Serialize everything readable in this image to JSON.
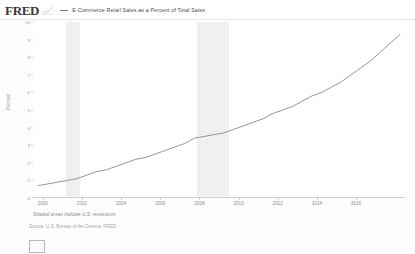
{
  "header": {
    "logo_text": "FRED",
    "logo_icon": "line-chart-icon",
    "series_legend_label": "E-Commerce Retail Sales as a Percent of Total Sales"
  },
  "footer": {
    "recession_note": "Shaded areas indicate U.S. recessions",
    "source": "Source: U.S. Bureau of the Census, FRED"
  },
  "chart_data": {
    "type": "line",
    "title": "E-Commerce Retail Sales as a Percent of Total Sales",
    "xlabel": "",
    "ylabel": "Percent",
    "xlim": [
      1999.5,
      2018.5
    ],
    "ylim": [
      0,
      10
    ],
    "grid": false,
    "legend_position": "top",
    "ytick_labels": [
      "0",
      "1",
      "2",
      "3",
      "4",
      "5",
      "6",
      "7",
      "8",
      "9",
      "10"
    ],
    "ytick_values": [
      0,
      1,
      2,
      3,
      4,
      5,
      6,
      7,
      8,
      9,
      10
    ],
    "xtick_labels": [
      "2000",
      "2002",
      "2004",
      "2006",
      "2008",
      "2010",
      "2012",
      "2014",
      "2016"
    ],
    "xtick_values": [
      2000,
      2002,
      2004,
      2006,
      2008,
      2010,
      2012,
      2014,
      2016
    ],
    "line_color": "#8a8a8a",
    "recession_color": "#eef0f2",
    "recession_bands": [
      {
        "start": 2001.2,
        "end": 2001.9
      },
      {
        "start": 2007.9,
        "end": 2009.5
      }
    ],
    "series": [
      {
        "name": "E-Commerce Retail Sales as a Percent of Total Sales",
        "x": [
          1999.75,
          2000.25,
          2000.75,
          2001.25,
          2001.75,
          2002.25,
          2002.75,
          2003.25,
          2003.75,
          2004.25,
          2004.75,
          2005.25,
          2005.75,
          2006.25,
          2006.75,
          2007.25,
          2007.75,
          2008.25,
          2008.75,
          2009.25,
          2009.75,
          2010.25,
          2010.75,
          2011.25,
          2011.75,
          2012.25,
          2012.75,
          2013.25,
          2013.75,
          2014.25,
          2014.75,
          2015.25,
          2015.75,
          2016.25,
          2016.75,
          2017.25,
          2017.75,
          2018.25
        ],
        "values": [
          0.7,
          0.8,
          0.9,
          1.0,
          1.1,
          1.3,
          1.5,
          1.6,
          1.8,
          2.0,
          2.2,
          2.3,
          2.5,
          2.7,
          2.9,
          3.1,
          3.4,
          3.5,
          3.6,
          3.7,
          3.9,
          4.1,
          4.3,
          4.5,
          4.8,
          5.0,
          5.2,
          5.5,
          5.8,
          6.0,
          6.3,
          6.6,
          7.0,
          7.4,
          7.8,
          8.3,
          8.8,
          9.3
        ]
      }
    ]
  }
}
